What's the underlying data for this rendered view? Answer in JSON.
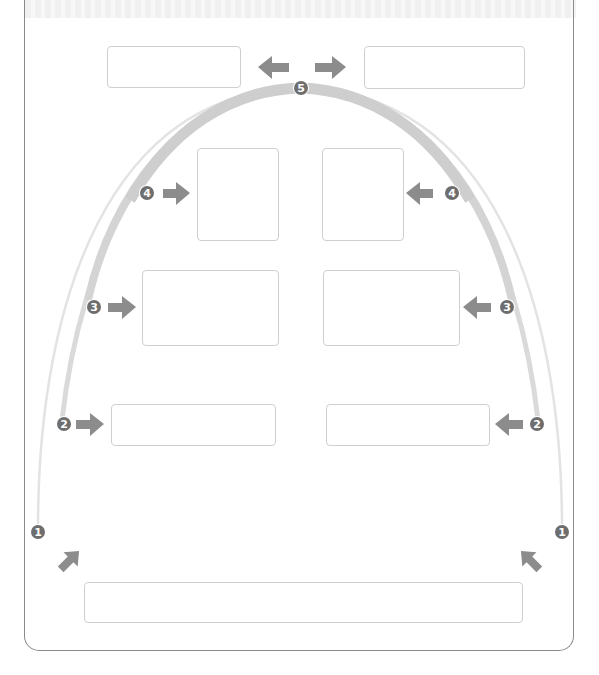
{
  "diagram": {
    "type": "arch-flow-worksheet",
    "colors": {
      "arch": "#d2d2d2",
      "arrow": "#8c8c8c",
      "badge": "#6e6e6e",
      "box_border": "#cfcfcf",
      "card_border": "#8a8a8a"
    },
    "steps": [
      {
        "number": "1",
        "badge_glyph": "❶",
        "side": "both",
        "arrow_direction": "inward-up"
      },
      {
        "number": "2",
        "badge_glyph": "❷",
        "side": "both",
        "arrow_direction": "inward"
      },
      {
        "number": "3",
        "badge_glyph": "❸",
        "side": "both",
        "arrow_direction": "inward"
      },
      {
        "number": "4",
        "badge_glyph": "❹",
        "side": "both",
        "arrow_direction": "inward"
      },
      {
        "number": "5",
        "badge_glyph": "❺",
        "side": "center",
        "arrow_direction": "outward"
      }
    ],
    "boxes": [
      {
        "id": "top-left",
        "text": ""
      },
      {
        "id": "top-right",
        "text": ""
      },
      {
        "id": "step4-left",
        "text": ""
      },
      {
        "id": "step4-right",
        "text": ""
      },
      {
        "id": "step3-left",
        "text": ""
      },
      {
        "id": "step3-right",
        "text": ""
      },
      {
        "id": "step2-left",
        "text": ""
      },
      {
        "id": "step2-right",
        "text": ""
      },
      {
        "id": "bottom",
        "text": ""
      }
    ]
  }
}
